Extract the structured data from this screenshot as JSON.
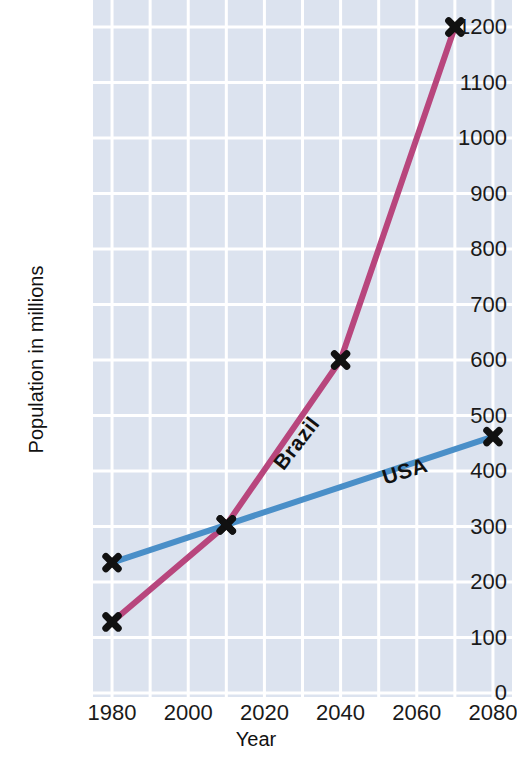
{
  "chart_data": {
    "type": "line",
    "title": "",
    "xlabel": "Year",
    "ylabel": "Population in millions",
    "xlim": [
      1975,
      2085
    ],
    "ylim": [
      0,
      1200
    ],
    "xticks": [
      1980,
      2000,
      2020,
      2040,
      2060,
      2080
    ],
    "yticks": [
      0,
      100,
      200,
      300,
      400,
      500,
      600,
      700,
      800,
      900,
      1000,
      1100,
      1200
    ],
    "grid": true,
    "grid_color": "#ffffff",
    "plot_background": "#dce3ef",
    "legend": "inline-labels",
    "marker": "x",
    "marker_color": "#111111",
    "series": [
      {
        "name": "Brazil",
        "color": "#b8467d",
        "x": [
          1980,
          2010,
          2040,
          2070
        ],
        "values": [
          128,
          303,
          600,
          1200
        ]
      },
      {
        "name": "USA",
        "color": "#4a8fc8",
        "x": [
          1980,
          2010,
          2080
        ],
        "values": [
          235,
          303,
          462
        ]
      }
    ]
  },
  "axis": {
    "y_title": "Population in millions",
    "x_title": "Year",
    "y_tick_labels": [
      "1200",
      "1100",
      "1000",
      "900",
      "800",
      "700",
      "600",
      "500",
      "400",
      "300",
      "200",
      "100",
      "0"
    ],
    "x_tick_labels": [
      "1980",
      "2000",
      "2020",
      "2040",
      "2060",
      "2080"
    ]
  },
  "annotations": {
    "brazil_label": "Brazil",
    "usa_label": "USA"
  }
}
